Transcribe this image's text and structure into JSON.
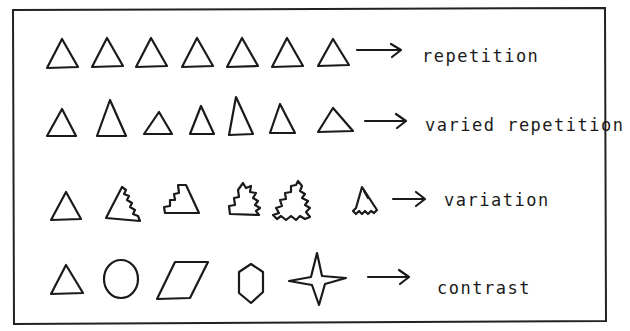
{
  "diagram": {
    "colors": {
      "ink": "#1a1a1a",
      "background": "#ffffff"
    },
    "rows": [
      {
        "id": "repetition",
        "label": "repetition",
        "shapes": [
          "triangle",
          "triangle",
          "triangle",
          "triangle",
          "triangle",
          "triangle",
          "triangle"
        ],
        "arrow": "right-arrow"
      },
      {
        "id": "varied-repetition",
        "label": "varied repetition",
        "shapes": [
          "triangle-small",
          "triangle-tall",
          "triangle-small",
          "triangle-narrow",
          "triangle-tallest",
          "triangle-narrow",
          "triangle-wide"
        ],
        "arrow": "right-arrow"
      },
      {
        "id": "variation",
        "label": "variation",
        "shapes": [
          "triangle",
          "triangle-jagged-right",
          "triangle-stepped-left",
          "triangle-stepped-jagged",
          "triangle-fully-jagged",
          "triangle-jagged-base"
        ],
        "arrow": "right-arrow"
      },
      {
        "id": "contrast",
        "label": "contrast",
        "shapes": [
          "triangle",
          "circle",
          "parallelogram",
          "hexagon",
          "four-point-star"
        ],
        "arrow": "right-arrow"
      }
    ]
  }
}
